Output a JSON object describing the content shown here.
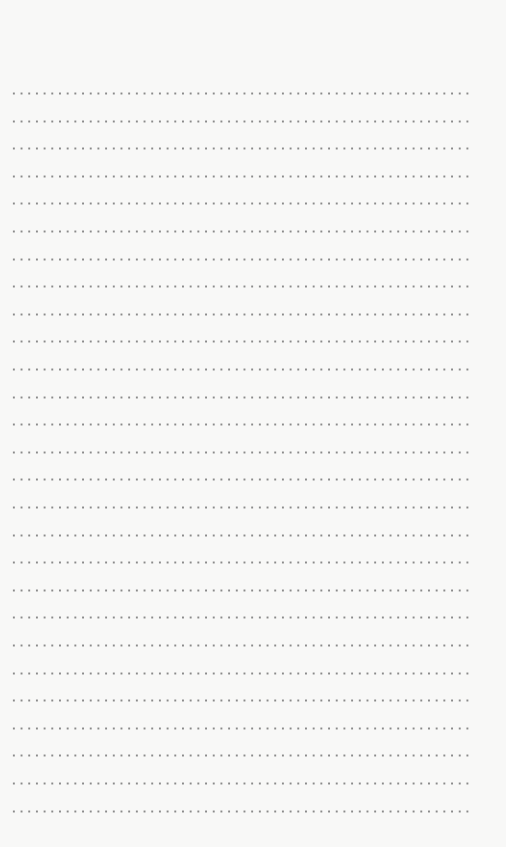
{
  "page": {
    "type": "dotted-line-paper",
    "line_count": 27,
    "first_line_y": 92,
    "line_spacing": 27.6,
    "dot_spacing": 7.7,
    "colors": {
      "background": "#f8f8f7",
      "dot": "#8a8a8a"
    }
  }
}
